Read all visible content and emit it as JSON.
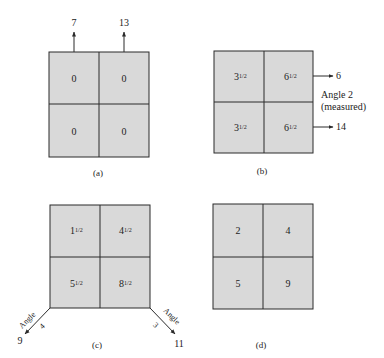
{
  "colors": {
    "cell_fill": "#d9d9d9",
    "line": "#2a2a2a",
    "text": "#222222",
    "background": "#ffffff"
  },
  "panels": [
    {
      "caption": "(a)",
      "cells": [
        [
          "0",
          "0"
        ],
        [
          "0",
          "0"
        ]
      ],
      "arrows": [
        {
          "direction": "up",
          "column": 1,
          "value": "7"
        },
        {
          "direction": "up",
          "column": 2,
          "value": "13"
        }
      ]
    },
    {
      "caption": "(b)",
      "cells": [
        [
          {
            "whole": "3",
            "frac": "1/2"
          },
          {
            "whole": "6",
            "frac": "1/2"
          }
        ],
        [
          {
            "whole": "3",
            "frac": "1/2"
          },
          {
            "whole": "6",
            "frac": "1/2"
          }
        ]
      ],
      "arrows": [
        {
          "direction": "right",
          "row": 1,
          "value": "6"
        },
        {
          "direction": "right",
          "row": 2,
          "value": "14"
        }
      ],
      "angle_label_line1": "Angle 2",
      "angle_label_line2": "(measured)"
    },
    {
      "caption": "(c)",
      "cells": [
        [
          {
            "whole": "1",
            "frac": "1/2"
          },
          {
            "whole": "4",
            "frac": "1/2"
          }
        ],
        [
          {
            "whole": "5",
            "frac": "1/2"
          },
          {
            "whole": "8",
            "frac": "1/2"
          }
        ]
      ],
      "arrows": [
        {
          "direction": "down-left",
          "value": "9",
          "angle_word": "Angle",
          "angle_num": "4"
        },
        {
          "direction": "down-right",
          "value": "11",
          "angle_word": "Angle",
          "angle_num": "3"
        }
      ]
    },
    {
      "caption": "(d)",
      "cells": [
        [
          "2",
          "4"
        ],
        [
          "5",
          "9"
        ]
      ]
    }
  ]
}
